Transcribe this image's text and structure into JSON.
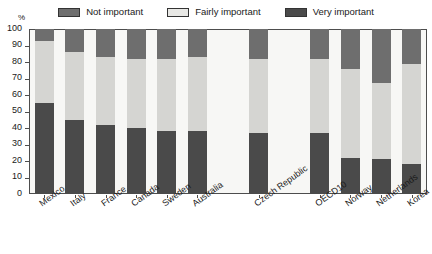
{
  "chart_data": {
    "type": "bar",
    "subtype": "stacked-bar-100",
    "title": "",
    "xlabel": "",
    "ylabel": "%",
    "ylim": [
      0,
      100
    ],
    "yticks": [
      0,
      10,
      20,
      30,
      40,
      50,
      60,
      70,
      80,
      90,
      100
    ],
    "grid": false,
    "legend_position": "top-center",
    "categories": [
      "Mexico",
      "Italy",
      "France",
      "Canada",
      "Sweden",
      "Australia",
      "Czech Republic",
      "OECD10",
      "Norway",
      "Netherlands",
      "Korea"
    ],
    "series": [
      {
        "name": "Very important",
        "color": "#4a4a4a",
        "values": [
          55,
          45,
          42,
          40,
          38,
          38,
          37,
          37,
          22,
          21,
          18
        ]
      },
      {
        "name": "Fairly important",
        "color": "#d5d5d2",
        "values": [
          38,
          41,
          41,
          42,
          44,
          45,
          45,
          45,
          54,
          46,
          61
        ]
      },
      {
        "name": "Not important",
        "color": "#6e6e6e",
        "values": [
          7,
          14,
          17,
          18,
          18,
          17,
          18,
          18,
          24,
          33,
          21
        ]
      }
    ],
    "cumulative_tops": {
      "very_important": [
        55,
        45,
        42,
        40,
        38,
        38,
        37,
        37,
        22,
        21,
        18
      ],
      "fairly_important_top": [
        93,
        86,
        83,
        82,
        82,
        83,
        82,
        82,
        76,
        67,
        79
      ]
    },
    "gap_after_index": [
      6,
      7
    ]
  },
  "legend": {
    "items": [
      {
        "label": "Not important",
        "swatch": "#6e6e6e"
      },
      {
        "label": "Fairly important",
        "swatch": "#e8e8e5"
      },
      {
        "label": "Very important",
        "swatch": "#4a4a4a"
      }
    ]
  },
  "axes": {
    "y_unit_label": "%",
    "y_tick_labels": [
      "100",
      "90",
      "80",
      "70",
      "60",
      "50",
      "40",
      "30",
      "20",
      "10",
      "0"
    ]
  }
}
